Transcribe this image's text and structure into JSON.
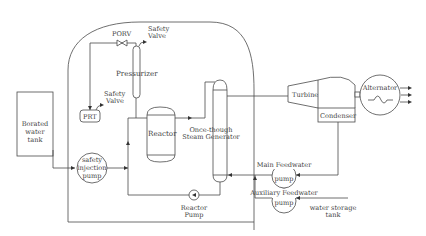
{
  "diagram": {
    "labels": {
      "porv": "PORV",
      "safety_valve_top_1": "Safety",
      "safety_valve_top_2": "Valve",
      "pressurizer": "Pressurizer",
      "prt": "PRT",
      "safety_valve_prt_1": "Safety",
      "safety_valve_prt_2": "Valve",
      "reactor": "Reactor",
      "steam_gen_1": "Once-though",
      "steam_gen_2": "Steam Generator",
      "turbine": "Turbine",
      "condenser": "Condenser",
      "alternator": "Alternator",
      "borated_1": "Borated",
      "borated_2": "water",
      "borated_3": "tank",
      "si_pump_1": "safety",
      "si_pump_2": "injection",
      "si_pump_3": "pump",
      "reactor_pump_1": "Reactor",
      "reactor_pump_2": "Pump",
      "main_fw_1": "Main Feedwater",
      "main_fw_2": "pump",
      "aux_fw_1": "Auxiliary Feedwater",
      "aux_fw_2": "pump",
      "wst_1": "water storage",
      "wst_2": "tank"
    }
  }
}
